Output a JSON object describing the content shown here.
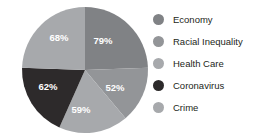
{
  "chart_data": {
    "type": "pie",
    "title": "",
    "subtitle": "",
    "xlabel": "",
    "ylabel": "",
    "grid": false,
    "legend_position": "right",
    "categories": [
      "Economy",
      "Racial Inequality",
      "Health Care",
      "Coronavirus",
      "Crime"
    ],
    "values": [
      79,
      52,
      59,
      62,
      68
    ],
    "data_labels": [
      "79%",
      "52%",
      "59%",
      "62%",
      "68%"
    ],
    "colors": [
      "#808285",
      "#939598",
      "#a7a9ac",
      "#2d2a2b",
      "#a7a9ac"
    ],
    "slices": [
      {
        "label": "Economy",
        "value": 79,
        "data_label": "79%",
        "color": "#808285",
        "start_angle": 0,
        "end_angle": 88,
        "label_x": 103,
        "label_y": 41
      },
      {
        "label": "Racial Inequality",
        "value": 52,
        "data_label": "52%",
        "color": "#939598",
        "start_angle": 88,
        "end_angle": 140,
        "label_x": 115,
        "label_y": 88
      },
      {
        "label": "Health Care",
        "value": 59,
        "data_label": "59%",
        "color": "#a7a9ac",
        "start_angle": 140,
        "end_angle": 204,
        "label_x": 81,
        "label_y": 110
      },
      {
        "label": "Coronavirus",
        "value": 62,
        "data_label": "62%",
        "color": "#2d2a2b",
        "start_angle": 204,
        "end_angle": 272,
        "label_x": 48,
        "label_y": 87
      },
      {
        "label": "Crime",
        "value": 68,
        "data_label": "68%",
        "color": "#a7a9ac",
        "start_angle": 272,
        "end_angle": 360,
        "label_x": 59,
        "label_y": 38
      }
    ]
  },
  "legend": {
    "items": [
      {
        "label": "Economy",
        "color": "#808285"
      },
      {
        "label": "Racial Inequality",
        "color": "#939598"
      },
      {
        "label": "Health Care",
        "color": "#a7a9ac"
      },
      {
        "label": "Coronavirus",
        "color": "#2d2a2b"
      },
      {
        "label": "Crime",
        "color": "#a7a9ac"
      }
    ]
  }
}
